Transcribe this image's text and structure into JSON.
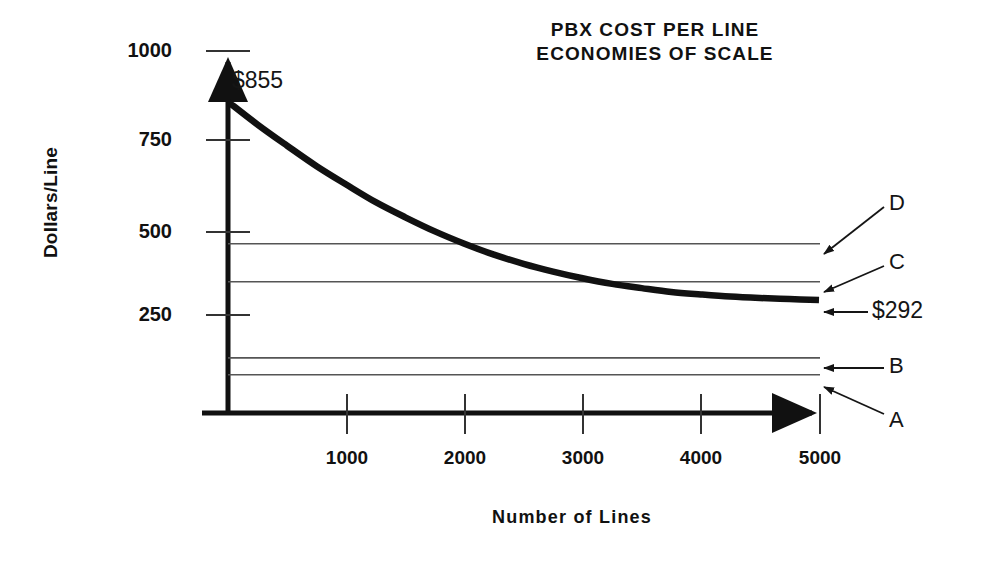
{
  "chart_data": {
    "type": "line",
    "title_line1": "PBX COST PER LINE",
    "title_line2": "ECONOMIES OF SCALE",
    "xlabel": "Number of Lines",
    "ylabel": "Dollars/Line",
    "xlim": [
      0,
      5400
    ],
    "ylim": [
      0,
      1060
    ],
    "grid": false,
    "legend_position": "right-inline-annotations",
    "xticks": [
      1000,
      2000,
      3000,
      4000,
      5000
    ],
    "xtick_labels": [
      "1000",
      "2000",
      "3000",
      "4000",
      "5000"
    ],
    "yticks": [
      250,
      500,
      750,
      1000
    ],
    "ytick_labels": [
      "250",
      "500",
      "750",
      "1000"
    ],
    "series": [
      {
        "name": "PBX cost per line",
        "style": "thick-curve",
        "start_label": "$855",
        "end_label": "$292",
        "start_value": 855,
        "end_value": 292,
        "x": [
          0,
          250,
          500,
          750,
          1000,
          1250,
          1500,
          1750,
          2000,
          2250,
          2500,
          2750,
          3000,
          3250,
          3500,
          3750,
          4000,
          4250,
          4500,
          4750,
          5000
        ],
        "values": [
          855,
          790,
          730,
          672,
          620,
          570,
          527,
          487,
          452,
          421,
          395,
          373,
          354,
          338,
          326,
          315,
          308,
          302,
          298,
          295,
          292
        ]
      },
      {
        "name": "D",
        "style": "thin-horizontal",
        "value": 452,
        "label": "D"
      },
      {
        "name": "C",
        "style": "thin-horizontal",
        "value": 344,
        "label": "C"
      },
      {
        "name": "B",
        "style": "thin-horizontal",
        "value": 128,
        "label": "B"
      },
      {
        "name": "A",
        "style": "thin-horizontal",
        "value": 80,
        "label": "A"
      }
    ],
    "annotations": [
      {
        "text": "$855",
        "target": "curve start",
        "x": 0,
        "y": 855
      },
      {
        "text": "$292",
        "target": "curve end",
        "x": 5000,
        "y": 292
      },
      {
        "text": "D",
        "target": "line D",
        "x": 5000,
        "y": 452
      },
      {
        "text": "C",
        "target": "line C",
        "x": 5000,
        "y": 344
      },
      {
        "text": "B",
        "target": "line B",
        "x": 5000,
        "y": 128
      },
      {
        "text": "A",
        "target": "line A",
        "x": 5000,
        "y": 80
      }
    ]
  },
  "labels": {
    "title_line1": "PBX COST PER LINE",
    "title_line2": "ECONOMIES OF SCALE",
    "ylabel": "Dollars/Line",
    "xlabel": "Number of Lines",
    "y_1000": "1000",
    "y_750": "750",
    "y_500": "500",
    "y_250": "250",
    "x_1000": "1000",
    "x_2000": "2000",
    "x_3000": "3000",
    "x_4000": "4000",
    "x_5000": "5000",
    "start_value": "$855",
    "end_value": "$292",
    "line_d": "D",
    "line_c": "C",
    "line_b": "B",
    "line_a": "A"
  },
  "colors": {
    "ink": "#111111",
    "background": "#ffffff",
    "thin_line": "#555555"
  }
}
